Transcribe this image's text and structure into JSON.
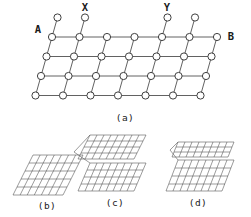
{
  "figure": {
    "panels": [
      {
        "id": "a",
        "caption": "(a)",
        "kind": "lattice-network"
      },
      {
        "id": "b",
        "caption": "(b)",
        "kind": "flat-grid-sheet"
      },
      {
        "id": "c",
        "caption": "(c)",
        "kind": "folded-grid-sheet-deep"
      },
      {
        "id": "d",
        "caption": "(d)",
        "kind": "folded-grid-sheet-shallow"
      }
    ],
    "terminal_labels": [
      {
        "name": "A",
        "text": "A",
        "position": "left-of-top-row"
      },
      {
        "name": "B",
        "text": "B",
        "position": "right-of-top-row"
      },
      {
        "name": "X",
        "text": "X",
        "position": "above-left-pendant-pair"
      },
      {
        "name": "Y",
        "text": "Y",
        "position": "above-right-pendant-pair"
      }
    ],
    "lattice": {
      "rows": 4,
      "nodes_per_row": 7,
      "pendant_nodes": 4,
      "row_shift_x": -5.5,
      "row_spacing_y": 19.5,
      "col_spacing_x": 27.5,
      "node_radius": 3.6,
      "origin": {
        "x": 52,
        "y": 37
      }
    },
    "sheets": {
      "b": {
        "cols": 7,
        "rows": 5,
        "folds": 0
      },
      "c": {
        "cols": 9,
        "rows": 5,
        "folds": 1,
        "fold_depth": "deep"
      },
      "d": {
        "cols": 9,
        "rows": 5,
        "folds": 1,
        "fold_depth": "shallow"
      }
    },
    "colors": {
      "background": "#fdfdfb",
      "ink": "#2a2a2a",
      "edge": "#3a3a3a",
      "grid": "#4a4a4a",
      "node_fill": "#ffffff"
    }
  }
}
